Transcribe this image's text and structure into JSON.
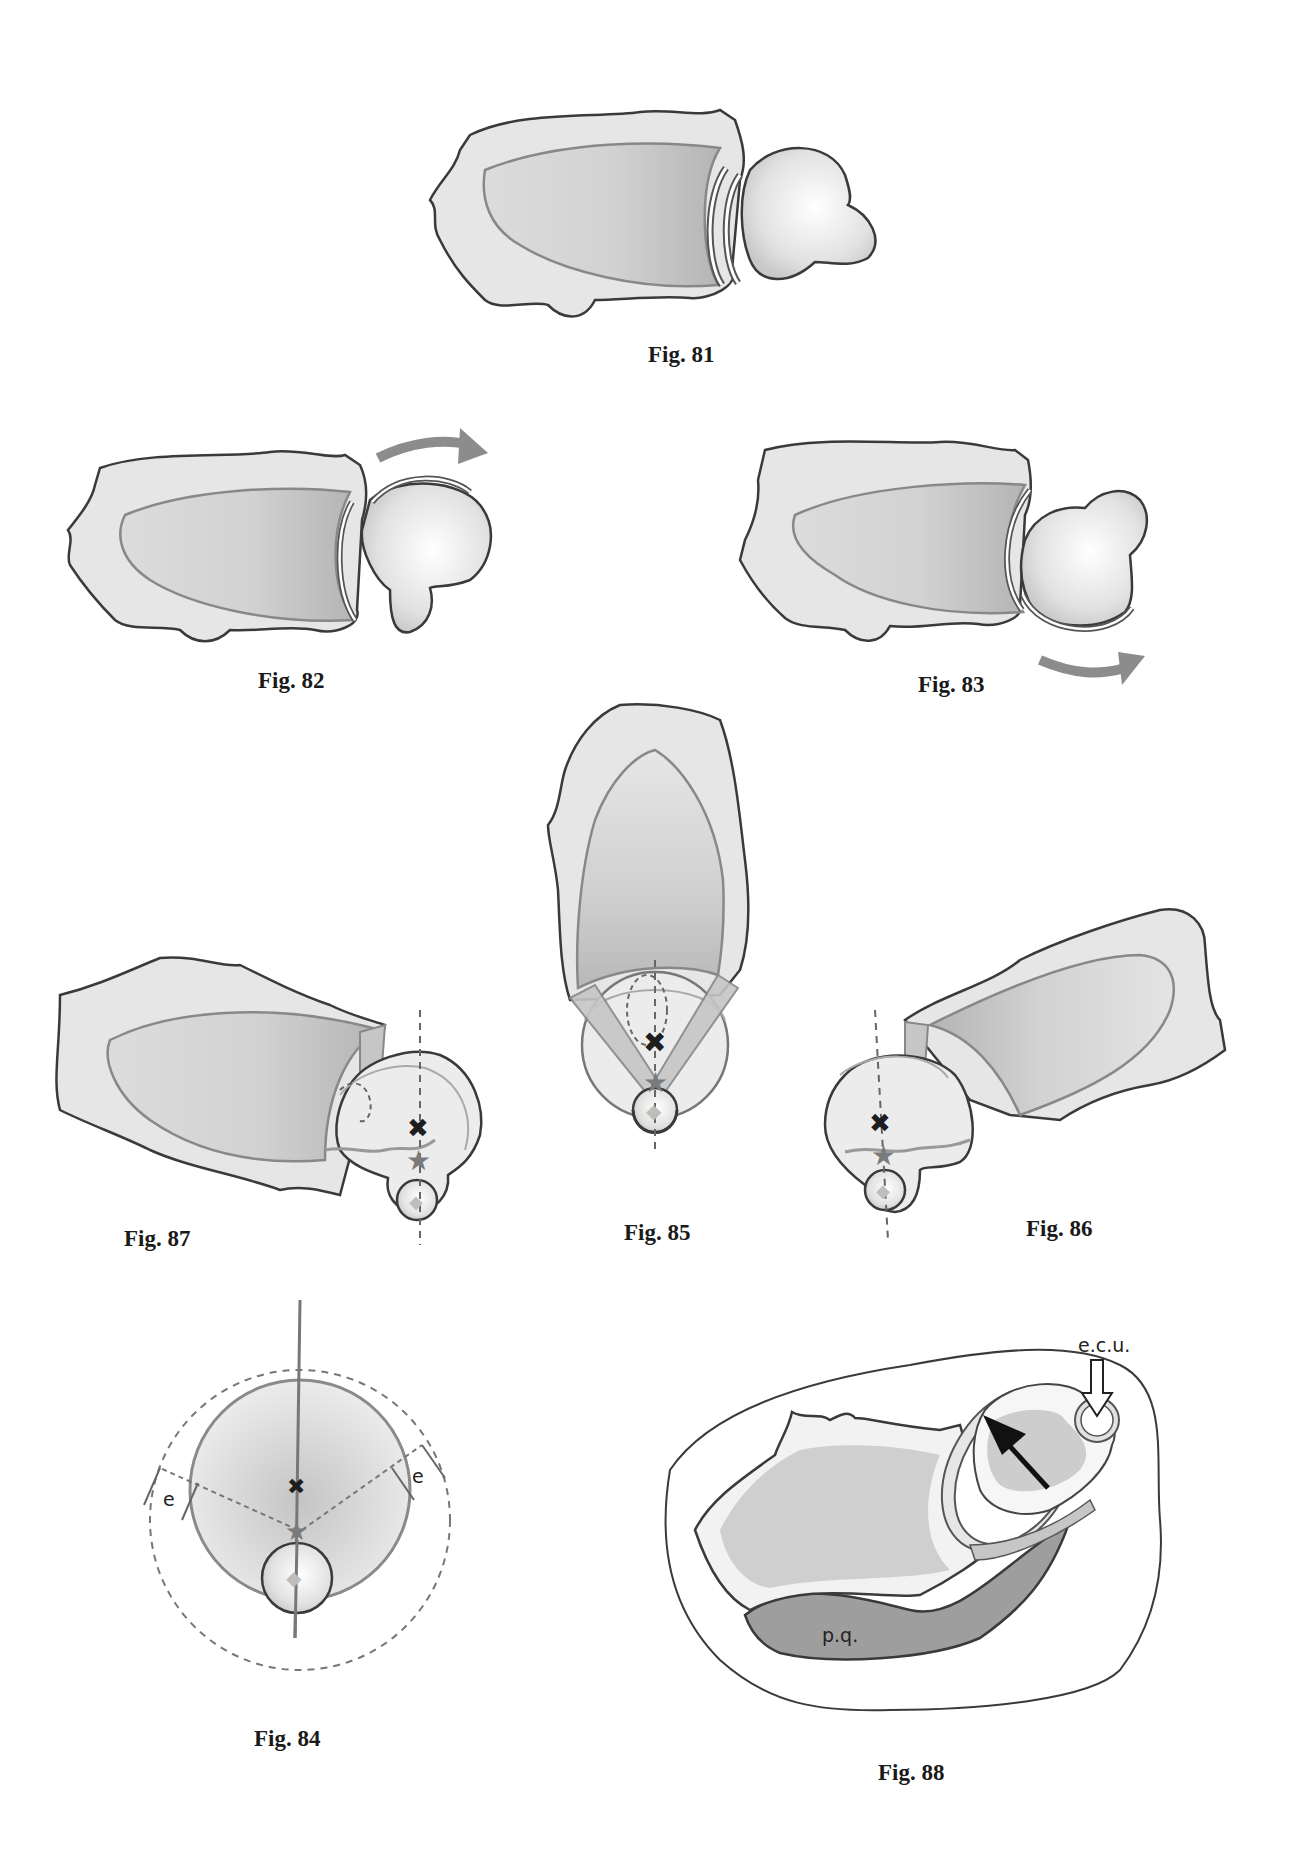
{
  "page": {
    "colors": {
      "bone_fill": "#e6e6e6",
      "bone_shadow": "#cfcfcf",
      "articular_fill": "#c9c9c9",
      "outline_dark": "#3a3a3a",
      "outline_mid": "#888888",
      "arrow_gray": "#8c8c8c",
      "muscle_fill": "#9e9e9e"
    }
  },
  "figures": [
    {
      "id": "fig81",
      "caption": "Fig. 81",
      "view": "lateral neutral"
    },
    {
      "id": "fig82",
      "caption": "Fig. 82",
      "view": "rotation with upper arrow",
      "arrow": "clockwise-right-top"
    },
    {
      "id": "fig83",
      "caption": "Fig. 83",
      "view": "rotation with lower arrow",
      "arrow": "right-bottom"
    },
    {
      "id": "fig85",
      "caption": "Fig. 85",
      "view": "axial vertical with center markers"
    },
    {
      "id": "fig87",
      "caption": "Fig. 87",
      "view": "axial rotated left"
    },
    {
      "id": "fig86",
      "caption": "Fig. 86",
      "view": "axial rotated right"
    },
    {
      "id": "fig84",
      "caption": "Fig. 84",
      "view": "schematic circles",
      "labels": [
        "e",
        "e"
      ]
    },
    {
      "id": "fig88",
      "caption": "Fig. 88",
      "view": "cross-section",
      "labels": {
        "tendon": "e.c.u.",
        "muscle": "p.q."
      }
    }
  ],
  "markers": {
    "cross": "rotation-center-cross",
    "star": "contact-star",
    "diamond": "ulnar-center-diamond"
  }
}
